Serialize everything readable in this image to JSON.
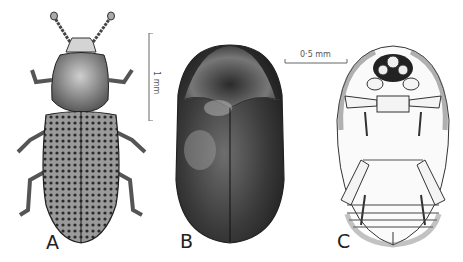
{
  "figure": {
    "panels": [
      {
        "id": "A",
        "label": "A",
        "description": "dorsal view of elongate beetle with punctate striate elytra"
      },
      {
        "id": "B",
        "label": "B",
        "description": "dorsal view of oval pubescent beetle"
      },
      {
        "id": "C",
        "label": "C",
        "description": "ventral view of oval beetle"
      }
    ],
    "scale_bars": [
      {
        "id": "scale-A",
        "text": "1 mm",
        "orientation": "vertical"
      },
      {
        "id": "scale-BC",
        "text": "0·5 mm",
        "orientation": "horizontal"
      }
    ],
    "colors": {
      "ink": "#222222",
      "background": "#ffffff",
      "dark_tone": "#2a2a2a",
      "mid_tone": "#6a6a6a"
    }
  }
}
